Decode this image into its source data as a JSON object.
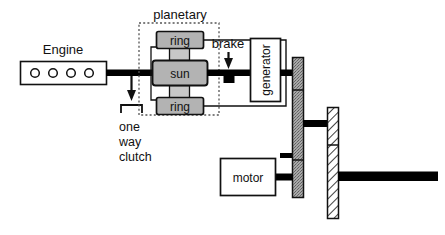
{
  "diagram": {
    "colors": {
      "stroke": "#111111",
      "shaft": "#000000",
      "gear_fill": "#b3b3b3",
      "planet_fill": "#c8c8c8",
      "dotted_bar_fill": "#9e9e9e",
      "hatch_fill": "#ffffff",
      "background": "#ffffff",
      "dashed_border": "#555555"
    },
    "labels": {
      "engine": "Engine",
      "planetary": "planetary",
      "ring_top": "ring",
      "sun": "sun",
      "ring_bottom": "ring",
      "brake": "brake",
      "generator": "generator",
      "motor": "motor",
      "one_way_clutch_line1": "one",
      "one_way_clutch_line2": "way",
      "one_way_clutch_line3": "clutch"
    },
    "engine": {
      "cylinder_count": 4,
      "box": {
        "x": 20,
        "y": 61,
        "w": 86,
        "h": 23
      }
    },
    "planetary": {
      "dashed_box": {
        "x": 139,
        "y": 23,
        "w": 80,
        "h": 92
      }
    },
    "generator": {
      "box": {
        "x": 250,
        "y": 38,
        "w": 30,
        "h": 63
      },
      "text_orientation": "vertical-bottom-to-top"
    },
    "motor": {
      "box": {
        "x": 220,
        "y": 158,
        "w": 55,
        "h": 37
      }
    },
    "bars": {
      "dotted_bar": {
        "x": 292,
        "y": 57,
        "w": 11,
        "h": 140,
        "fill_pattern": "stipple"
      },
      "hatched_bar": {
        "x": 327,
        "y": 107,
        "w": 11,
        "h": 111,
        "fill_pattern": "diagonal-hatch"
      }
    },
    "output_shaft": {
      "x": 338,
      "y": 172,
      "w": 100,
      "h": 9
    }
  }
}
